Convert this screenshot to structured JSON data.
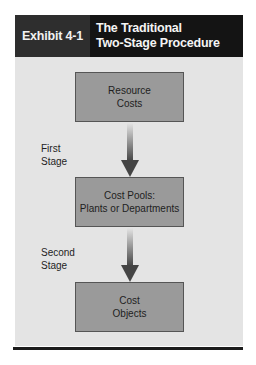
{
  "header": {
    "exhibit_label": "Exhibit 4-1",
    "title_line1": "The Traditional",
    "title_line2": "Two-Stage Procedure"
  },
  "diagram": {
    "nodes": [
      {
        "line1": "Resource",
        "line2": "Costs"
      },
      {
        "line1": "Cost Pools:",
        "line2": "Plants or Departments"
      },
      {
        "line1": "Cost",
        "line2": "Objects"
      }
    ],
    "stages": [
      {
        "line1": "First",
        "line2": "Stage"
      },
      {
        "line1": "Second",
        "line2": "Stage"
      }
    ],
    "colors": {
      "header_left": "#2e2e2e",
      "header_right": "#141414",
      "panel": "#e4e4e4",
      "box_fill": "#9a9a9a",
      "arrow": "#4a4a4a"
    }
  }
}
